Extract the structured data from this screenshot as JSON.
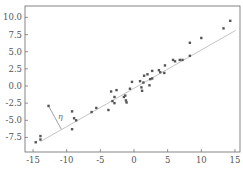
{
  "chart_data": {
    "type": "scatter",
    "title": "",
    "xlabel": "",
    "ylabel": "",
    "xlim": [
      -15.5,
      15.5
    ],
    "ylim": [
      -9.6,
      11.2
    ],
    "grid": false,
    "legend": null,
    "x_ticks": [
      -15,
      -10,
      -5,
      0,
      5,
      10,
      15
    ],
    "x_tick_labels": [
      "-15",
      "-10",
      "-5",
      "0",
      "5",
      "10",
      "15"
    ],
    "y_ticks": [
      10.0,
      7.5,
      5.0,
      2.5,
      0.0,
      -2.5,
      -5.0,
      -7.5
    ],
    "y_tick_labels": [
      "10.0",
      "7.5",
      "5.0",
      "2.5",
      "0.0",
      "-2.5",
      "-5.0",
      "-7.5"
    ],
    "series": [
      {
        "name": "points",
        "kind": "scatter",
        "color": "#555555",
        "x": [
          -14.6,
          -13.9,
          -13.9,
          -12.7,
          -9.2,
          -9.2,
          -8.9,
          -8.6,
          -6.3,
          -5.6,
          -3.8,
          -3.4,
          -2.6,
          -2.9,
          -3.2,
          -2.9,
          -1.5,
          -1.3,
          -1.2,
          -1.1,
          -0.6,
          -0.3,
          0.9,
          1.1,
          1.2,
          1.4,
          1.5,
          2.0,
          2.3,
          2.4,
          2.7,
          2.7,
          3.7,
          3.9,
          4.5,
          4.6,
          5.8,
          6.1,
          6.8,
          7.2,
          8.3,
          8.3,
          10.0,
          13.3,
          14.3
        ],
        "y": [
          -8.2,
          -7.8,
          -7.3,
          -2.9,
          -3.7,
          -6.3,
          -4.7,
          -5.0,
          -3.8,
          -3.2,
          -3.5,
          -0.8,
          -0.6,
          -1.6,
          -2.2,
          -2.5,
          -1.6,
          -1.4,
          -2.1,
          -2.4,
          -0.4,
          0.6,
          0.7,
          -0.2,
          -0.7,
          0.5,
          1.5,
          1.7,
          0.1,
          1.0,
          1.1,
          2.2,
          2.3,
          2.0,
          1.9,
          3.0,
          3.8,
          3.6,
          3.8,
          3.8,
          4.4,
          6.3,
          7.0,
          8.4,
          9.5
        ]
      },
      {
        "name": "fit line",
        "kind": "line",
        "color": "#c4c4c4",
        "x": [
          -13.9,
          15.1
        ],
        "y": [
          -8.1,
          8.1
        ]
      }
    ],
    "annotations": [
      {
        "text": "η",
        "type": "residual-segment",
        "from": [
          -12.7,
          -2.9
        ],
        "to": [
          -10.8,
          -6.3
        ]
      }
    ]
  }
}
